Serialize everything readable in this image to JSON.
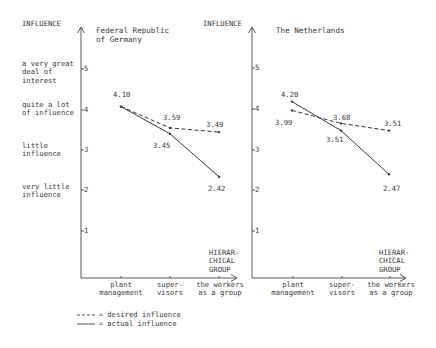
{
  "y_axis_title": "INFLUENCE",
  "x_axis_title": "HIERAR-\nCHICAL\nGROUP",
  "y_category_labels": [
    {
      "text": "a very great\ndeal of\ninterest",
      "level": 5
    },
    {
      "text": "quite a lot\nof influence",
      "level": 4
    },
    {
      "text": "little\ninfluence",
      "level": 3
    },
    {
      "text": "very little\ninfluence",
      "level": 2
    }
  ],
  "y_ticks": [
    "5",
    "4",
    "3",
    "2",
    "1"
  ],
  "x_categories": [
    "plant\nmanagement",
    "super-\nvisors",
    "the workers\nas a group"
  ],
  "legend": {
    "desired": "---- = desired influence",
    "actual": "——— = actual influence"
  },
  "colors": {
    "ink": "#3a3a3a",
    "background": "#ffffff"
  },
  "chart_data": [
    {
      "type": "line",
      "title": "Federal Republic\nof Germany",
      "xlabel": "HIERARCHICAL GROUP",
      "ylabel": "INFLUENCE",
      "ylim": [
        0,
        5.5
      ],
      "categories": [
        "plant management",
        "supervisors",
        "the workers as a group"
      ],
      "series": [
        {
          "name": "desired influence",
          "style": "dashed",
          "values": [
            4.1,
            3.59,
            3.49
          ]
        },
        {
          "name": "actual influence",
          "style": "solid",
          "values": [
            4.1,
            3.45,
            2.42
          ]
        }
      ],
      "labels": [
        "4.10",
        "3.59",
        "3.49",
        "3.45",
        "2.42"
      ]
    },
    {
      "type": "line",
      "title": "The Netherlands",
      "xlabel": "HIERARCHICAL GROUP",
      "ylabel": "INFLUENCE",
      "ylim": [
        0,
        5.5
      ],
      "categories": [
        "plant management",
        "supervisors",
        "the workers as a group"
      ],
      "series": [
        {
          "name": "desired influence",
          "style": "dashed",
          "values": [
            3.99,
            3.68,
            3.51
          ]
        },
        {
          "name": "actual influence",
          "style": "solid",
          "values": [
            4.2,
            3.51,
            2.47
          ]
        }
      ],
      "labels": [
        "4.20",
        "3.99",
        "3.68",
        "3.51",
        "3.51",
        "2.47"
      ]
    }
  ]
}
